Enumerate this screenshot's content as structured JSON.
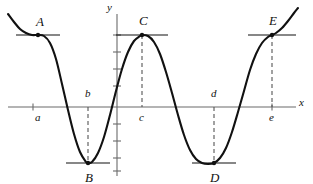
{
  "figure": {
    "kind": "calculus-graph",
    "background": "#ffffff",
    "ink": "#111111",
    "axis_color": "#6b6b6b",
    "curve_color": "#111111",
    "dash_color": "#555555"
  },
  "axes": {
    "x_label": "x",
    "y_label": "y",
    "x_axis_y_px": 107,
    "y_axis_x_px": 117,
    "x_axis_from_px": 8,
    "x_axis_to_px": 296,
    "y_axis_from_px": 14,
    "y_axis_to_px": 176,
    "x_ticks_px": [
      33,
      272
    ],
    "y_ticks_px": [
      35,
      52,
      69,
      86,
      124,
      141,
      158,
      171
    ]
  },
  "chart_data": {
    "type": "line",
    "title": "",
    "xlabel": "x",
    "ylabel": "y",
    "grid": false,
    "legend": null,
    "curve_points_px": [
      [
        8,
        14
      ],
      [
        14,
        22
      ],
      [
        20,
        29
      ],
      [
        26,
        33
      ],
      [
        32,
        35
      ],
      [
        38,
        35
      ],
      [
        44,
        36
      ],
      [
        50,
        43
      ],
      [
        56,
        59
      ],
      [
        62,
        84
      ],
      [
        68,
        110
      ],
      [
        74,
        134
      ],
      [
        80,
        152
      ],
      [
        86,
        162
      ],
      [
        88,
        163
      ],
      [
        92,
        162
      ],
      [
        98,
        153
      ],
      [
        104,
        137
      ],
      [
        110,
        115
      ],
      [
        116,
        91
      ],
      [
        122,
        69
      ],
      [
        128,
        52
      ],
      [
        134,
        41
      ],
      [
        140,
        36
      ],
      [
        142,
        35
      ],
      [
        148,
        36
      ],
      [
        154,
        42
      ],
      [
        160,
        54
      ],
      [
        166,
        72
      ],
      [
        172,
        93
      ],
      [
        178,
        115
      ],
      [
        184,
        135
      ],
      [
        190,
        150
      ],
      [
        196,
        159
      ],
      [
        202,
        163
      ],
      [
        208,
        164
      ],
      [
        214,
        163
      ],
      [
        220,
        158
      ],
      [
        226,
        148
      ],
      [
        232,
        132
      ],
      [
        238,
        112
      ],
      [
        244,
        91
      ],
      [
        250,
        70
      ],
      [
        256,
        54
      ],
      [
        262,
        43
      ],
      [
        268,
        37
      ],
      [
        272,
        35
      ],
      [
        276,
        33
      ],
      [
        282,
        28
      ],
      [
        288,
        21
      ],
      [
        294,
        13
      ],
      [
        298,
        8
      ]
    ],
    "annotations": [
      {
        "label": "A",
        "x_px": 38,
        "y_px": 35,
        "kind": "horizontal-tangent-plateau",
        "dot": true,
        "tangent": true,
        "tangent_half_width_px": 22,
        "label_dx_px": -2,
        "label_dy_px": -20,
        "dashed_drop": false,
        "axis_label": "a",
        "axis_label_side": "below"
      },
      {
        "label": "B",
        "x_px": 88,
        "y_px": 163,
        "kind": "local-minimum",
        "dot": true,
        "tangent": true,
        "tangent_half_width_px": 22,
        "label_dx_px": -3,
        "label_dy_px": 8,
        "dashed_drop": true,
        "axis_label": "b",
        "axis_label_side": "above"
      },
      {
        "label": "C",
        "x_px": 142,
        "y_px": 35,
        "kind": "local-maximum",
        "dot": true,
        "tangent": true,
        "tangent_half_width_px": 26,
        "label_dx_px": -3,
        "label_dy_px": -21,
        "dashed_drop": true,
        "axis_label": "c",
        "axis_label_side": "below"
      },
      {
        "label": "D",
        "x_px": 214,
        "y_px": 163,
        "kind": "local-minimum",
        "dot": true,
        "tangent": true,
        "tangent_half_width_px": 22,
        "label_dx_px": -4,
        "label_dy_px": 8,
        "dashed_drop": true,
        "axis_label": "d",
        "axis_label_side": "above"
      },
      {
        "label": "E",
        "x_px": 272,
        "y_px": 35,
        "kind": "horizontal-tangent-inflection",
        "dot": true,
        "tangent": true,
        "tangent_half_width_px": 24,
        "label_dx_px": -3,
        "label_dy_px": -21,
        "dashed_drop": true,
        "axis_label": "e",
        "axis_label_side": "below"
      }
    ]
  },
  "point_labels": {
    "A": "A",
    "B": "B",
    "C": "C",
    "D": "D",
    "E": "E"
  },
  "axis_value_labels": {
    "a": "a",
    "b": "b",
    "c": "c",
    "d": "d",
    "e": "e"
  }
}
